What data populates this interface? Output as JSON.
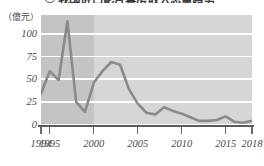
{
  "title": {
    "bullet": "3",
    "text": "我国进口影片票房收入总量趋势"
  },
  "axis": {
    "unit_label": "（億元）",
    "y_ticks": [
      "0",
      "25",
      "50",
      "75",
      "100"
    ],
    "x_ticks": [
      "1994",
      "1995",
      "2000",
      "2005",
      "2010",
      "2015",
      "2018"
    ]
  },
  "colors": {
    "plot_background": "#d6d6d6",
    "shaded_band": "#c4c4c4",
    "gridline": "#ffffff",
    "line": "#8a8a8a",
    "axis": "#5b5b5b",
    "text": "#4a4a4a"
  },
  "chart_data": {
    "type": "line",
    "title": "我国进口影片票房收入总量趋势",
    "xlabel": "",
    "ylabel": "億元",
    "xlim": [
      1994,
      2018
    ],
    "ylim": [
      0,
      113
    ],
    "grid": true,
    "legend": "none",
    "y_ticks": [
      0,
      25,
      50,
      75,
      100
    ],
    "x_tick_labels": [
      1994,
      1995,
      2000,
      2005,
      2010,
      2015,
      2018
    ],
    "shaded_region": {
      "from": 1994,
      "to": 2000,
      "note": "darker background band"
    },
    "x": [
      1994,
      1995,
      1996,
      1997,
      1998,
      1999,
      2000,
      2001,
      2002,
      2003,
      2004,
      2005,
      2006,
      2007,
      2008,
      2009,
      2010,
      2011,
      2012,
      2013,
      2014,
      2015,
      2016,
      2017,
      2018
    ],
    "series": [
      {
        "name": "进口影片票房收入",
        "values": [
          33,
          58,
          48,
          113,
          24,
          13,
          45,
          58,
          68,
          65,
          38,
          22,
          12,
          10,
          18,
          14,
          11,
          7,
          3,
          3,
          4,
          8,
          2,
          1,
          3
        ]
      }
    ]
  }
}
